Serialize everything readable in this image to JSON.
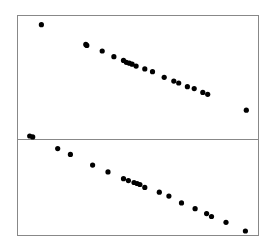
{
  "chart_data": [
    {
      "type": "scatter",
      "panel": "top",
      "title": "",
      "xlabel": "",
      "ylabel": "",
      "grid": false,
      "legend": "none",
      "xlim": [
        0,
        100
      ],
      "ylim": [
        0,
        100
      ],
      "points": [
        {
          "x": 8.7,
          "y": 95
        },
        {
          "x": 27.7,
          "y": 74
        },
        {
          "x": 28.1,
          "y": 73
        },
        {
          "x": 34.7,
          "y": 67
        },
        {
          "x": 39.7,
          "y": 61
        },
        {
          "x": 43.8,
          "y": 57
        },
        {
          "x": 45.0,
          "y": 55
        },
        {
          "x": 46.3,
          "y": 54
        },
        {
          "x": 47.5,
          "y": 53
        },
        {
          "x": 49.2,
          "y": 51
        },
        {
          "x": 52.9,
          "y": 48
        },
        {
          "x": 56.2,
          "y": 45
        },
        {
          "x": 61.2,
          "y": 39
        },
        {
          "x": 65.3,
          "y": 35
        },
        {
          "x": 67.4,
          "y": 33
        },
        {
          "x": 71.1,
          "y": 29
        },
        {
          "x": 74.0,
          "y": 27
        },
        {
          "x": 77.7,
          "y": 23
        },
        {
          "x": 79.8,
          "y": 21
        },
        {
          "x": 96.3,
          "y": 4
        }
      ]
    },
    {
      "type": "scatter",
      "panel": "bottom",
      "title": "",
      "xlabel": "",
      "ylabel": "",
      "grid": false,
      "legend": "none",
      "xlim": [
        0,
        100
      ],
      "ylim": [
        0,
        100
      ],
      "points": [
        {
          "x": 3.7,
          "y": 99
        },
        {
          "x": 5.0,
          "y": 98
        },
        {
          "x": 15.7,
          "y": 86
        },
        {
          "x": 21.1,
          "y": 80
        },
        {
          "x": 30.6,
          "y": 69
        },
        {
          "x": 37.2,
          "y": 62
        },
        {
          "x": 43.8,
          "y": 55
        },
        {
          "x": 45.9,
          "y": 53
        },
        {
          "x": 48.3,
          "y": 51
        },
        {
          "x": 49.6,
          "y": 50
        },
        {
          "x": 50.8,
          "y": 49
        },
        {
          "x": 52.9,
          "y": 46
        },
        {
          "x": 59.1,
          "y": 41
        },
        {
          "x": 63.2,
          "y": 37
        },
        {
          "x": 68.6,
          "y": 30
        },
        {
          "x": 74.4,
          "y": 24
        },
        {
          "x": 79.3,
          "y": 19
        },
        {
          "x": 81.4,
          "y": 16
        },
        {
          "x": 87.6,
          "y": 10
        },
        {
          "x": 95.9,
          "y": 1
        }
      ]
    }
  ],
  "style": {
    "point_color": "#000000",
    "frame_color": "#888888",
    "background": "#ffffff"
  }
}
